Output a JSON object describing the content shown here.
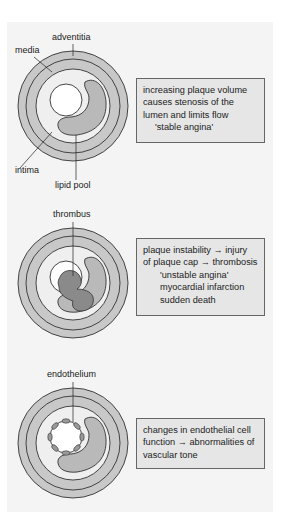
{
  "colors": {
    "background": "#ffffff",
    "panel": "#f4f4f4",
    "outer_rings": "#c8c8c8",
    "intima": "#efefef",
    "lipid_pool": "#b9b9b9",
    "thrombus": "#8a8a8a",
    "lumen": "#ffffff",
    "outline": "#333333",
    "box_fill": "#e6e6e6",
    "box_border": "#666666"
  },
  "panels": [
    {
      "id": "stable",
      "labels": {
        "adventitia": "adventitia",
        "media": "media",
        "intima": "intima",
        "lipid_pool": "lipid pool"
      },
      "box_lines": [
        "increasing plaque volume",
        "causes stenosis of the",
        "lumen and limits flow",
        "'stable angina'"
      ]
    },
    {
      "id": "unstable",
      "labels": {
        "thrombus": "thrombus"
      },
      "box_lines": [
        "plaque instability → injury",
        "of plaque cap → thrombosis",
        "'unstable angina'",
        "myocardial infarction",
        "sudden death"
      ]
    },
    {
      "id": "endothelial",
      "labels": {
        "endothelium": "endothelium"
      },
      "box_lines": [
        "changes in endothelial cell",
        "function → abnormalities of",
        "vascular tone"
      ]
    }
  ]
}
